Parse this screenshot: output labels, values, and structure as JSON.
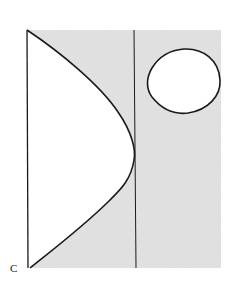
{
  "figure": {
    "labels": [
      {
        "id": "corner-label",
        "text": "C",
        "x": 10,
        "y": 272
      }
    ],
    "colors": {
      "background": "#ffffff",
      "shaded_region": "#e3e3e3",
      "stroke": "#1a1a1a",
      "white_region": "#ffffff"
    },
    "shaded_rect": {
      "x": 27,
      "y": 30,
      "width": 194,
      "height": 238
    },
    "left_boundary": {
      "x": 27,
      "y1": 30,
      "y2": 268
    },
    "divider_line": {
      "x": 134,
      "y1": 30,
      "y2": 268
    },
    "curve_vertex": {
      "x": 134,
      "y": 155
    },
    "oval": {
      "cx": 184,
      "cy": 81,
      "rx": 37,
      "ry": 32
    }
  }
}
